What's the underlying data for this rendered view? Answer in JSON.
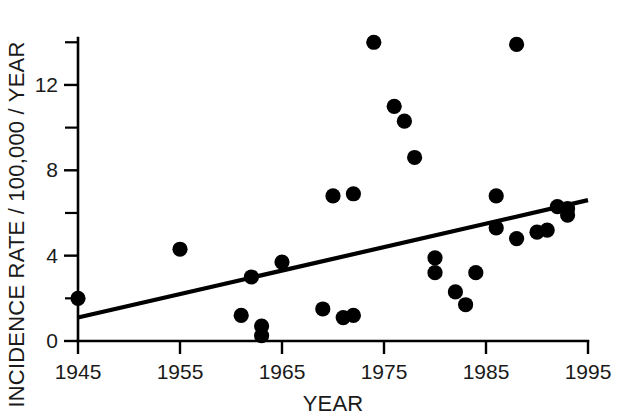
{
  "chart_data": {
    "type": "scatter",
    "title": "",
    "xlabel": "YEAR",
    "ylabel": "INCIDENCE RATE / 100,000 / YEAR",
    "xlim": [
      1945,
      1995
    ],
    "ylim": [
      0,
      14.2
    ],
    "grid": false,
    "legend": null,
    "x_ticks": [
      1945,
      1955,
      1965,
      1975,
      1985,
      1995
    ],
    "x_tick_labels": [
      "1945",
      "1955",
      "1965",
      "1975",
      "1985",
      "1995"
    ],
    "x_minor_ticks": [
      1950,
      1960,
      1970,
      1980,
      1990
    ],
    "y_ticks": [
      0,
      4,
      8,
      12
    ],
    "y_tick_labels": [
      "0",
      "4",
      "8",
      "12"
    ],
    "y_minor_ticks": [
      2,
      6,
      10,
      14
    ],
    "marker": "filled-circle",
    "marker_color": "#000000",
    "points": [
      {
        "x": 1945,
        "y": 2.0
      },
      {
        "x": 1955,
        "y": 4.3
      },
      {
        "x": 1961,
        "y": 1.2
      },
      {
        "x": 1962,
        "y": 3.0
      },
      {
        "x": 1963,
        "y": 0.7
      },
      {
        "x": 1963,
        "y": 0.25
      },
      {
        "x": 1965,
        "y": 3.7
      },
      {
        "x": 1969,
        "y": 1.5
      },
      {
        "x": 1970,
        "y": 6.8
      },
      {
        "x": 1971,
        "y": 1.1
      },
      {
        "x": 1972,
        "y": 6.9
      },
      {
        "x": 1972,
        "y": 1.2
      },
      {
        "x": 1974,
        "y": 14.0
      },
      {
        "x": 1976,
        "y": 11.0
      },
      {
        "x": 1977,
        "y": 10.3
      },
      {
        "x": 1978,
        "y": 8.6
      },
      {
        "x": 1980,
        "y": 3.9
      },
      {
        "x": 1980,
        "y": 3.2
      },
      {
        "x": 1982,
        "y": 2.3
      },
      {
        "x": 1983,
        "y": 1.7
      },
      {
        "x": 1984,
        "y": 3.2
      },
      {
        "x": 1986,
        "y": 6.8
      },
      {
        "x": 1986,
        "y": 5.3
      },
      {
        "x": 1988,
        "y": 13.9
      },
      {
        "x": 1988,
        "y": 4.8
      },
      {
        "x": 1990,
        "y": 5.1
      },
      {
        "x": 1991,
        "y": 5.2
      },
      {
        "x": 1992,
        "y": 6.3
      },
      {
        "x": 1993,
        "y": 5.9
      },
      {
        "x": 1993,
        "y": 6.2
      }
    ],
    "trend_line": {
      "type": "linear-regression",
      "x_start": 1945,
      "y_start": 1.1,
      "x_end": 1995,
      "y_end": 6.6
    }
  }
}
